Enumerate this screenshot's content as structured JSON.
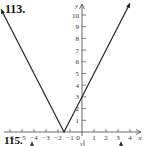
{
  "problem_label": "113.",
  "next_problem_label": "115.",
  "chart_data": {
    "type": "line",
    "title": "",
    "xlabel": "x",
    "ylabel": "y",
    "function": "y = |2x + 3|",
    "x_ticks": [
      -6,
      -5,
      -4,
      -3,
      -2,
      -1,
      0,
      1,
      2,
      3,
      4
    ],
    "x_tick_labels": [
      "−6",
      "−5",
      "−4",
      "−3",
      "−2",
      "−1",
      "0",
      "1",
      "2",
      "3",
      "4"
    ],
    "y_ticks": [
      1,
      2,
      3,
      4,
      5,
      6,
      7,
      8,
      9,
      10
    ],
    "y_tick_labels": [
      "1",
      "2",
      "3",
      "4",
      "5",
      "6",
      "7",
      "8",
      "9",
      "10"
    ],
    "xlim": [
      -6.5,
      4.5
    ],
    "ylim": [
      0,
      11
    ],
    "grid": false,
    "series": [
      {
        "name": "y = |2x+3|",
        "x": [
          -6.75,
          -1.5,
          4
        ],
        "y": [
          10.5,
          0,
          11
        ]
      }
    ],
    "vertex": {
      "x": -1.5,
      "y": 0
    },
    "y_intercept": 3,
    "color": "#222222"
  }
}
